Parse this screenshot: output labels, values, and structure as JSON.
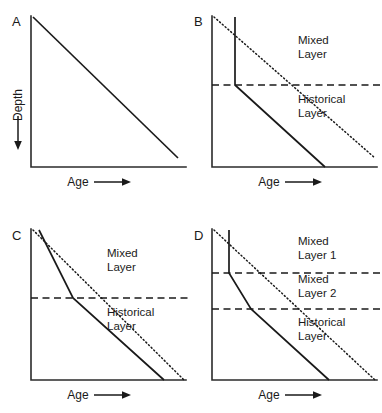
{
  "figure": {
    "axis_labels": {
      "x": "Age",
      "y": "Depth"
    },
    "panels": [
      {
        "id": "A",
        "letter": "A",
        "xlabel": "Age",
        "ylabel": "Depth",
        "layer_labels": [],
        "series": [
          {
            "name": "true-age-profile",
            "style": "solid",
            "points": [
              [
                0,
                0
              ],
              [
                100,
                93
              ]
            ]
          }
        ],
        "boundaries": []
      },
      {
        "id": "B",
        "letter": "B",
        "xlabel": "Age",
        "ylabel": "",
        "layer_labels": [
          "Mixed Layer",
          "Historical Layer"
        ],
        "series": [
          {
            "name": "apparent-age-profile",
            "style": "solid",
            "points": [
              [
                14,
                0
              ],
              [
                14,
                45
              ],
              [
                69,
                100
              ]
            ]
          },
          {
            "name": "true-age-reference",
            "style": "dotted",
            "points": [
              [
                0,
                0
              ],
              [
                100,
                93
              ]
            ]
          }
        ],
        "boundaries": [
          {
            "name": "mixed-historical-boundary",
            "depth": 45
          }
        ]
      },
      {
        "id": "C",
        "letter": "C",
        "xlabel": "Age",
        "ylabel": "",
        "layer_labels": [
          "Mixed Layer",
          "Historical Layer"
        ],
        "series": [
          {
            "name": "apparent-age-profile",
            "style": "solid",
            "points": [
              [
                4,
                0
              ],
              [
                28,
                45
              ],
              [
                73,
                100
              ]
            ]
          },
          {
            "name": "true-age-reference",
            "style": "dotted",
            "points": [
              [
                0,
                0
              ],
              [
                100,
                100
              ]
            ]
          }
        ],
        "boundaries": [
          {
            "name": "mixed-historical-boundary",
            "depth": 45
          }
        ]
      },
      {
        "id": "D",
        "letter": "D",
        "xlabel": "Age",
        "ylabel": "",
        "layer_labels": [
          "Mixed Layer 1",
          "Mixed Layer 2",
          "Historical Layer"
        ],
        "series": [
          {
            "name": "apparent-age-profile",
            "style": "solid",
            "points": [
              [
                10,
                0
              ],
              [
                10,
                29
              ],
              [
                24,
                53
              ],
              [
                72,
                100
              ]
            ]
          },
          {
            "name": "true-age-reference",
            "style": "dotted",
            "points": [
              [
                0,
                0
              ],
              [
                100,
                100
              ]
            ]
          }
        ],
        "boundaries": [
          {
            "name": "mixed1-mixed2-boundary",
            "depth": 29
          },
          {
            "name": "mixed2-historical-boundary",
            "depth": 53
          }
        ]
      }
    ]
  }
}
